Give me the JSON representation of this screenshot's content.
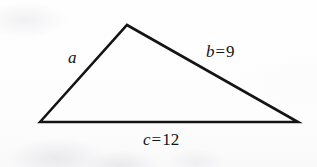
{
  "figure": {
    "kind": "triangle-diagram",
    "background_color": "#fdfdfc",
    "stroke_color": "#141414",
    "stroke_width": 2.6
  },
  "geometry": {
    "vertices": {
      "left": {
        "x": 40,
        "y": 122
      },
      "apex": {
        "x": 127,
        "y": 25
      },
      "right": {
        "x": 298,
        "y": 122
      }
    },
    "polygon_points": "40,122 127,25 298,122"
  },
  "labels": {
    "side_a": {
      "variable": "a",
      "relation": "",
      "value": "",
      "full_text": "a"
    },
    "side_b": {
      "variable": "b",
      "relation": "=",
      "value": "9",
      "full_text": "b = 9"
    },
    "side_c": {
      "variable": "c",
      "relation": "=",
      "value": "12",
      "full_text": "c = 12"
    }
  }
}
